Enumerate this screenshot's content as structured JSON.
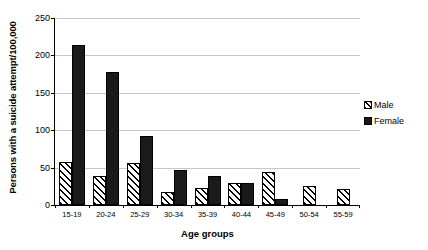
{
  "chart_data": {
    "type": "bar",
    "title": "",
    "xlabel": "Age groups",
    "ylabel": "Persons with a suicide attempt/100,000",
    "categories": [
      "15-19",
      "20-24",
      "25-29",
      "30-34",
      "35-39",
      "40-44",
      "45-49",
      "50-54",
      "55-59"
    ],
    "series": [
      {
        "name": "Male",
        "values": [
          58,
          39,
          56,
          18,
          23,
          30,
          44,
          26,
          22
        ],
        "color": "#ffffff",
        "pattern": "diagonal-hatch"
      },
      {
        "name": "Female",
        "values": [
          214,
          178,
          92,
          47,
          39,
          29,
          8,
          0,
          0
        ],
        "color": "#1a1a1a",
        "pattern": "solid"
      }
    ],
    "ylim": [
      0,
      250
    ],
    "yticks": [
      0,
      50,
      100,
      150,
      200,
      250
    ],
    "ytick_labels": [
      "0",
      "50",
      "100",
      "150",
      "200",
      "250"
    ],
    "grid": "horizontal",
    "grid_color": "#c8c8c8",
    "legend_position": "right"
  },
  "legend": {
    "items": [
      {
        "label": "Male"
      },
      {
        "label": "Female"
      }
    ]
  },
  "axes": {
    "y_title": "Persons with a suicide attempt/100,000",
    "x_title": "Age groups"
  }
}
